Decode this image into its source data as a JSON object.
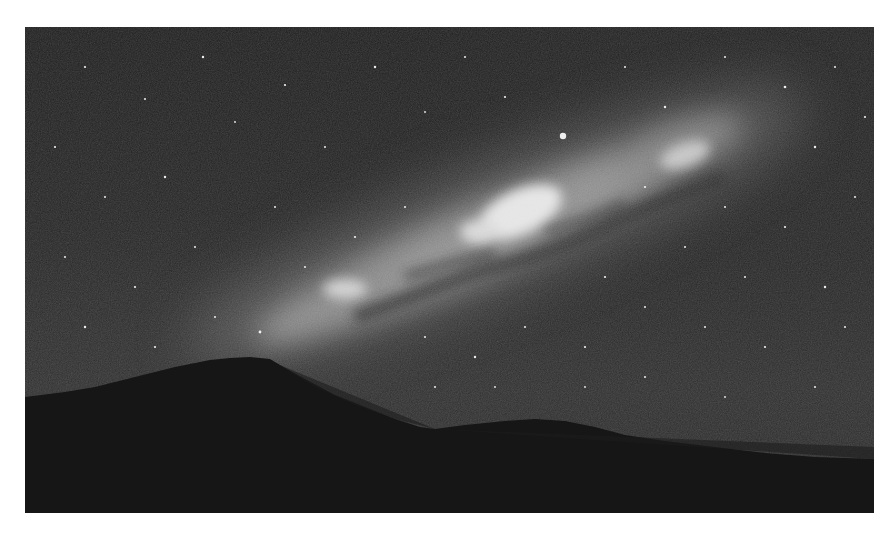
{
  "image": {
    "subject": "Milky Way over mountain silhouette at night",
    "style": "grayscale photograph",
    "frame": {
      "x": 25,
      "y": 27,
      "width": 849,
      "height": 486
    }
  },
  "colors": {
    "page_background": "#ffffff",
    "sky_dark": "#1f1f1f",
    "sky_mid": "#2c2c2c",
    "galaxy_glow": "#9a9a9a",
    "galaxy_core": "#e8e8e8",
    "dust_lane": "#2a2a2a",
    "mountain": "#151515",
    "star": "#f0f0f0"
  },
  "features": {
    "galactic_core": {
      "x": 495,
      "y": 183,
      "label": "galactic-core"
    },
    "bright_star": {
      "x": 538,
      "y": 109,
      "label": "bright-star"
    },
    "mountain_peak": {
      "x": 220,
      "y": 331,
      "label": "mountain-peak"
    }
  }
}
